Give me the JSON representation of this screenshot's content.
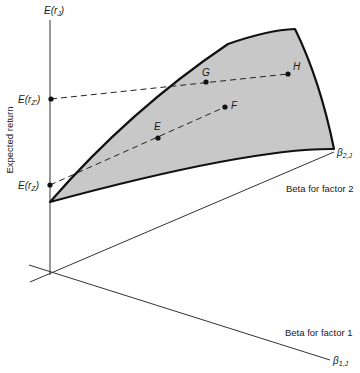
{
  "diagram": {
    "axes": {
      "vertical": {
        "symbol": "E(r",
        "symbol_sub": "J",
        "symbol_close": ")",
        "label": "Expected return"
      },
      "factor2": {
        "symbol": "β",
        "symbol_sub": "2,J",
        "label": "Beta for factor 2"
      },
      "factor1": {
        "symbol": "β",
        "symbol_sub": "1,J",
        "label": "Beta for factor 1"
      }
    },
    "intercepts": [
      {
        "id": "ez_prime",
        "text": "E(r",
        "sub": "Z'",
        "close": ")"
      },
      {
        "id": "ez",
        "text": "E(r",
        "sub": "Z",
        "close": ")"
      }
    ],
    "points": [
      {
        "id": "E",
        "label": "E"
      },
      {
        "id": "F",
        "label": "F"
      },
      {
        "id": "G",
        "label": "G"
      },
      {
        "id": "H",
        "label": "H"
      }
    ],
    "colors": {
      "plane_fill": "#c8c8c8",
      "plane_stroke": "#111111",
      "axis": "#333333",
      "dash": "#222222"
    }
  }
}
